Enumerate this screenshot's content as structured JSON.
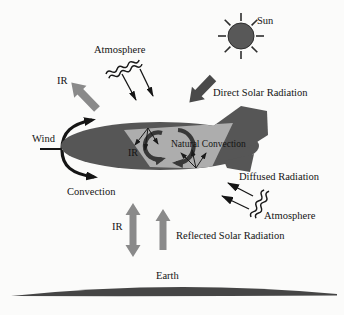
{
  "labels": {
    "sun": "Sun",
    "atmosphere_top": "Atmosphere",
    "ir_upper_left": "IR",
    "wind": "Wind",
    "convection": "Convection",
    "direct_solar_radiation": "Direct Solar Radiation",
    "ir_hull": "IR",
    "natural_convection": "Natural Convection",
    "diffused_radiation": "Diffused Radiation",
    "atmosphere_right": "Atmosphere",
    "ir_ground": "IR",
    "reflected_solar_radiation": "Reflected Solar Radiation",
    "earth": "Earth"
  },
  "colors": {
    "background": "#fbfbfa",
    "hull_body": "#565656",
    "hull_panel": "#adadad",
    "gray_arrow": "#8a8a8a",
    "dark_arrow": "#4a4a4a",
    "sun_fill": "#585858",
    "earth_fill": "#454545",
    "circulation_arrow": "#383838",
    "line_black": "#151515",
    "text": "#141414"
  }
}
